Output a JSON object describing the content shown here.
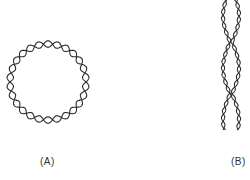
{
  "figure": {
    "panels": [
      {
        "id": "A",
        "label": "(A)",
        "description": "relaxed circular double helix"
      },
      {
        "id": "B",
        "label": "(B)",
        "description": "supercoiled double helix"
      }
    ],
    "colors": {
      "strand": "#2a2a2a",
      "background": "#ffffff",
      "label": "#333333"
    }
  }
}
